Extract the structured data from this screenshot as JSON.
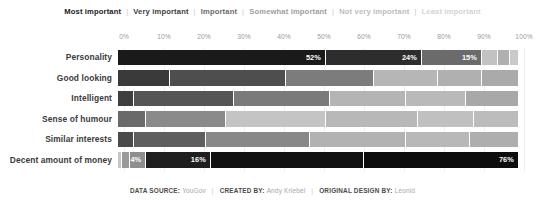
{
  "legend": {
    "separator": "|",
    "items": [
      {
        "label": "Most important",
        "color": "#1a1a1a"
      },
      {
        "label": "Very important",
        "color": "#3d3d3d"
      },
      {
        "label": "Important",
        "color": "#6b6b6b"
      },
      {
        "label": "Somewhat important",
        "color": "#9e9e9e"
      },
      {
        "label": "Not very important",
        "color": "#bdbdbd"
      },
      {
        "label": "Least important",
        "color": "#d4d4d4"
      }
    ]
  },
  "footer": {
    "separator": "|",
    "entries": [
      {
        "key": "DATA SOURCE:",
        "value": "YouGov"
      },
      {
        "key": "CREATED BY:",
        "value": "Andy Kriebel"
      },
      {
        "key": "ORIGINAL DESIGN BY:",
        "value": "Leonid"
      }
    ]
  },
  "chart_data": {
    "type": "bar",
    "title": "",
    "subtype": "stacked-horizontal-100-percent",
    "xlabel": "",
    "ylabel": "",
    "xlim": [
      0,
      100
    ],
    "grid": true,
    "legend_position": "top",
    "tick_labels": [
      "0%",
      "10%",
      "20%",
      "30%",
      "40%",
      "50%",
      "60%",
      "70%",
      "80%",
      "90%",
      "100%"
    ],
    "tick_values": [
      0,
      10,
      20,
      30,
      40,
      50,
      60,
      70,
      80,
      90,
      100
    ],
    "categories": [
      "Personality",
      "Good looking",
      "Intelligent",
      "Sense of humour",
      "Similar interests",
      "Decent amount of money"
    ],
    "series": [
      {
        "name": "Most important",
        "color": "#1a1a1a",
        "values": [
          52,
          13,
          4,
          7,
          4,
          1
        ]
      },
      {
        "name": "Very important",
        "color": "#3d3d3d",
        "values": [
          24,
          29,
          25,
          20,
          18,
          2
        ]
      },
      {
        "name": "Important",
        "color": "#6b6b6b",
        "values": [
          15,
          22,
          24,
          25,
          26,
          4
        ]
      },
      {
        "name": "Somewhat important",
        "color": "#9e9e9e",
        "values": [
          4,
          16,
          19,
          23,
          24,
          16
        ]
      },
      {
        "name": "Not very important",
        "color": "#bdbdbd",
        "values": [
          3,
          11,
          15,
          14,
          16,
          38
        ]
      },
      {
        "name": "Least important",
        "color": "#d4d4d4",
        "values": [
          2,
          9,
          13,
          11,
          12,
          38
        ]
      }
    ],
    "value_labels": [
      {
        "category": "Personality",
        "series": "Most important",
        "text": "52%"
      },
      {
        "category": "Personality",
        "series": "Very important",
        "text": "24%"
      },
      {
        "category": "Personality",
        "series": "Important",
        "text": "15%"
      },
      {
        "category": "Decent amount of money",
        "series": "Somewhat important",
        "text": "4%"
      },
      {
        "category": "Decent amount of money",
        "series": "Not very important",
        "text": "16%"
      },
      {
        "category": "Decent amount of money",
        "series": "Least important",
        "text": "76%"
      }
    ],
    "rows": [
      {
        "label": "Personality",
        "segments": [
          {
            "series": "Most important",
            "value": 52,
            "color": "#1a1a1a",
            "label": "52%"
          },
          {
            "series": "Very important",
            "value": 24,
            "color": "#2d2d2d",
            "label": "24%"
          },
          {
            "series": "Important",
            "value": 15,
            "color": "#6b6b6b",
            "label": "15%"
          },
          {
            "series": "Somewhat important",
            "value": 4,
            "color": "#c2c2c2",
            "label": ""
          },
          {
            "series": "Not very important",
            "value": 3,
            "color": "#b0b0b0",
            "label": ""
          },
          {
            "series": "Least important",
            "value": 2,
            "color": "#c9c9c9",
            "label": ""
          }
        ]
      },
      {
        "label": "Good looking",
        "segments": [
          {
            "series": "Most important",
            "value": 13,
            "color": "#3a3a3a",
            "label": ""
          },
          {
            "series": "Very important",
            "value": 29,
            "color": "#4e4e4e",
            "label": ""
          },
          {
            "series": "Important",
            "value": 22,
            "color": "#7c7c7c",
            "label": ""
          },
          {
            "series": "Somewhat important",
            "value": 16,
            "color": "#b6b6b6",
            "label": ""
          },
          {
            "series": "Not very important",
            "value": 11,
            "color": "#b0b0b0",
            "label": ""
          },
          {
            "series": "Least important",
            "value": 9,
            "color": "#aaaaaa",
            "label": ""
          }
        ]
      },
      {
        "label": "Intelligent",
        "segments": [
          {
            "series": "Most important",
            "value": 4,
            "color": "#3f3f3f",
            "label": ""
          },
          {
            "series": "Very important",
            "value": 25,
            "color": "#555555",
            "label": ""
          },
          {
            "series": "Important",
            "value": 24,
            "color": "#7a7a7a",
            "label": ""
          },
          {
            "series": "Somewhat important",
            "value": 19,
            "color": "#b4b4b4",
            "label": ""
          },
          {
            "series": "Not very important",
            "value": 15,
            "color": "#b9b9b9",
            "label": ""
          },
          {
            "series": "Least important",
            "value": 13,
            "color": "#a8a8a8",
            "label": ""
          }
        ]
      },
      {
        "label": "Sense of humour",
        "segments": [
          {
            "series": "Most important",
            "value": 7,
            "color": "#6a6a6a",
            "label": ""
          },
          {
            "series": "Very important",
            "value": 20,
            "color": "#8a8a8a",
            "label": ""
          },
          {
            "series": "Important",
            "value": 25,
            "color": "#c4c4c4",
            "label": ""
          },
          {
            "series": "Somewhat important",
            "value": 23,
            "color": "#b8b8b8",
            "label": ""
          },
          {
            "series": "Not very important",
            "value": 14,
            "color": "#c0c0c0",
            "label": ""
          },
          {
            "series": "Least important",
            "value": 11,
            "color": "#bcbcbc",
            "label": ""
          }
        ]
      },
      {
        "label": "Similar interests",
        "segments": [
          {
            "series": "Most important",
            "value": 4,
            "color": "#4a4a4a",
            "label": ""
          },
          {
            "series": "Very important",
            "value": 18,
            "color": "#5e5e5e",
            "label": ""
          },
          {
            "series": "Important",
            "value": 26,
            "color": "#888888",
            "label": ""
          },
          {
            "series": "Somewhat important",
            "value": 24,
            "color": "#b2b2b2",
            "label": ""
          },
          {
            "series": "Not very important",
            "value": 16,
            "color": "#b8b8b8",
            "label": ""
          },
          {
            "series": "Least important",
            "value": 12,
            "color": "#aeaeae",
            "label": ""
          }
        ]
      },
      {
        "label": "Decent amount of money",
        "segments": [
          {
            "series": "Most important",
            "value": 1,
            "color": "#c6c6c6",
            "label": ""
          },
          {
            "series": "Very important",
            "value": 2,
            "color": "#9a9a9a",
            "label": ""
          },
          {
            "series": "Important",
            "value": 4,
            "color": "#8e8e8e",
            "label": "4%"
          },
          {
            "series": "Somewhat important",
            "value": 16,
            "color": "#1f1f1f",
            "label": "16%"
          },
          {
            "series": "Not very important",
            "value": 38,
            "color": "#121212",
            "label": ""
          },
          {
            "series": "Least important",
            "value": 38,
            "color": "#0d0d0d",
            "label": "76%"
          }
        ]
      }
    ]
  }
}
